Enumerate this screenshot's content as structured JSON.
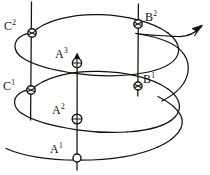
{
  "figure": {
    "background_color": "#fdfdfb",
    "stroke_color": "#15110f",
    "labels": [
      {
        "id": "c2",
        "base": "C",
        "sup": "2",
        "text": "C2",
        "x": 4,
        "y": 20
      },
      {
        "id": "c1",
        "base": "C",
        "sup": "1",
        "text": "C1",
        "x": 3,
        "y": 80
      },
      {
        "id": "a3",
        "base": "A",
        "sup": "3",
        "text": "A3",
        "x": 55,
        "y": 48
      },
      {
        "id": "a2",
        "base": "A",
        "sup": "2",
        "text": "A2",
        "x": 52,
        "y": 104
      },
      {
        "id": "a1",
        "base": "A",
        "sup": "1",
        "text": "A1",
        "x": 50,
        "y": 143
      },
      {
        "id": "b2",
        "base": "B",
        "sup": "2",
        "text": "B2",
        "x": 145,
        "y": 11
      },
      {
        "id": "b1",
        "base": "B",
        "sup": "1",
        "text": "B1",
        "x": 143,
        "y": 73
      }
    ],
    "vertical_lines": [
      {
        "id": "axis-left",
        "x": 31,
        "y1": 2,
        "y2": 120
      },
      {
        "id": "axis-middle",
        "x": 77,
        "y1": 54,
        "y2": 170
      },
      {
        "id": "axis-right",
        "x": 138,
        "y1": 4,
        "y2": 96
      }
    ],
    "nodes": [
      {
        "id": "node-c2",
        "label": "C2",
        "x": 32,
        "y": 33,
        "r": 4.2,
        "style": "crossed"
      },
      {
        "id": "node-c1",
        "label": "C1",
        "x": 31,
        "y": 90,
        "r": 4.2,
        "style": "crossed"
      },
      {
        "id": "node-a3",
        "label": "A3",
        "x": 77,
        "y": 63,
        "r": 4.6,
        "style": "crossed"
      },
      {
        "id": "node-a2",
        "label": "A2",
        "x": 77,
        "y": 119,
        "r": 4.8,
        "style": "crossed"
      },
      {
        "id": "node-a1",
        "label": "A1",
        "x": 77,
        "y": 158,
        "r": 4.0,
        "style": "plain"
      },
      {
        "id": "node-b2",
        "label": "B2",
        "x": 138,
        "y": 24,
        "r": 4.2,
        "style": "crossed"
      },
      {
        "id": "node-b1",
        "label": "B1",
        "x": 138,
        "y": 86,
        "r": 4.0,
        "style": "crossed"
      }
    ],
    "arrow": {
      "id": "direction-arrow",
      "description": "arrow pointing up and to the right",
      "tip_x": 202,
      "tip_y": 26
    },
    "curve_count": 3
  }
}
